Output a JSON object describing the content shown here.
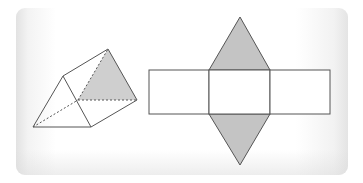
{
  "figure": {
    "colors": {
      "stroke": "#555555",
      "shade": "#c4c4c4",
      "background": "#ffffff",
      "card_edge": "#e2e2e2"
    },
    "prism": {
      "front_triangle": [
        [
          33,
          127
        ],
        [
          63,
          76
        ],
        [
          91,
          127
        ]
      ],
      "back_triangle_shaded": [
        [
          108,
          49
        ],
        [
          137,
          100
        ],
        [
          78,
          100
        ]
      ],
      "hidden_edges": [
        [
          [
            33,
            127
          ],
          [
            78,
            100
          ]
        ],
        [
          [
            78,
            100
          ],
          [
            108,
            49
          ]
        ],
        [
          [
            78,
            100
          ],
          [
            137,
            100
          ]
        ]
      ],
      "visible_edges": [
        [
          [
            63,
            76
          ],
          [
            108,
            49
          ]
        ],
        [
          [
            91,
            127
          ],
          [
            137,
            100
          ]
        ],
        [
          [
            108,
            49
          ],
          [
            137,
            100
          ]
        ]
      ]
    },
    "net": {
      "rectangles": [
        {
          "x": 149,
          "y": 70,
          "w": 60,
          "h": 44
        },
        {
          "x": 209,
          "y": 70,
          "w": 61,
          "h": 44
        },
        {
          "x": 270,
          "y": 70,
          "w": 60,
          "h": 44
        }
      ],
      "top_triangle_shaded": [
        [
          209,
          70
        ],
        [
          240,
          17
        ],
        [
          270,
          70
        ]
      ],
      "bottom_triangle_shaded": [
        [
          209,
          114
        ],
        [
          240,
          165
        ],
        [
          270,
          114
        ]
      ]
    }
  }
}
